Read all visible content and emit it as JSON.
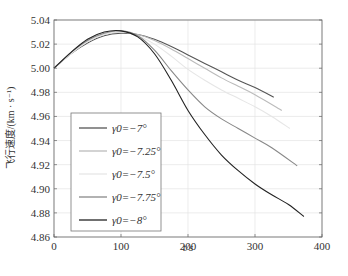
{
  "chart_data": {
    "type": "line",
    "title": "",
    "xlabel": "t/s",
    "ylabel": "飞行速度/(km · s⁻¹)",
    "xlim": [
      0,
      400
    ],
    "ylim": [
      4.86,
      5.04
    ],
    "xticks": [
      0,
      100,
      200,
      300,
      400
    ],
    "yticks": [
      4.86,
      4.88,
      4.9,
      4.92,
      4.94,
      4.96,
      4.98,
      5.0,
      5.02,
      5.04
    ],
    "ytick_labels": [
      "4.86",
      "4.88",
      "4.90",
      "4.92",
      "4.94",
      "4.96",
      "4.98",
      "5.00",
      "5.02",
      "5.04"
    ],
    "grid": true,
    "legend_position": "lower-left inside",
    "series": [
      {
        "name": "γ0=−7°",
        "color": "#555555",
        "x": [
          0,
          25,
          50,
          75,
          100,
          125,
          150,
          175,
          200,
          225,
          250,
          275,
          300,
          328
        ],
        "y": [
          5.0,
          5.012,
          5.021,
          5.027,
          5.029,
          5.028,
          5.024,
          5.018,
          5.011,
          5.004,
          4.997,
          4.99,
          4.984,
          4.976
        ]
      },
      {
        "name": "γ0=−7.25°",
        "color": "#bbbbbb",
        "x": [
          0,
          25,
          50,
          75,
          100,
          125,
          150,
          175,
          200,
          225,
          250,
          275,
          300,
          340
        ],
        "y": [
          5.0,
          5.012,
          5.022,
          5.028,
          5.03,
          5.028,
          5.023,
          5.016,
          5.008,
          5.0,
          4.992,
          4.985,
          4.978,
          4.965
        ]
      },
      {
        "name": "γ0=−7.5°",
        "color": "#e6e6e6",
        "x": [
          0,
          25,
          50,
          75,
          100,
          125,
          150,
          175,
          200,
          225,
          250,
          275,
          300,
          325,
          352
        ],
        "y": [
          5.0,
          5.012,
          5.022,
          5.028,
          5.03,
          5.027,
          5.02,
          5.01,
          4.999,
          4.99,
          4.982,
          4.975,
          4.968,
          4.96,
          4.95
        ]
      },
      {
        "name": "γ0=−7.75°",
        "color": "#888888",
        "x": [
          0,
          25,
          50,
          75,
          100,
          125,
          150,
          175,
          200,
          225,
          250,
          275,
          300,
          325,
          363
        ],
        "y": [
          5.0,
          5.013,
          5.023,
          5.029,
          5.031,
          5.027,
          5.015,
          4.998,
          4.982,
          4.968,
          4.958,
          4.95,
          4.942,
          4.934,
          4.919
        ]
      },
      {
        "name": "γ0=−8°",
        "color": "#222222",
        "x": [
          0,
          25,
          50,
          75,
          100,
          125,
          150,
          175,
          200,
          225,
          250,
          275,
          300,
          325,
          350,
          373
        ],
        "y": [
          5.0,
          5.013,
          5.024,
          5.03,
          5.031,
          5.026,
          5.012,
          4.99,
          4.965,
          4.945,
          4.928,
          4.915,
          4.904,
          4.895,
          4.887,
          4.877
        ]
      }
    ]
  },
  "axes": {
    "xlabel": "t/s",
    "ylabel": "飞行速度/(km · s⁻¹)"
  },
  "legend": {
    "items": [
      {
        "label": "γ0=−7°",
        "color": "#555555"
      },
      {
        "label": "γ0=−7.25°",
        "color": "#bbbbbb"
      },
      {
        "label": "γ0=−7.5°",
        "color": "#e6e6e6"
      },
      {
        "label": "γ0=−7.75°",
        "color": "#888888"
      },
      {
        "label": "γ0=−8°",
        "color": "#222222"
      }
    ]
  }
}
